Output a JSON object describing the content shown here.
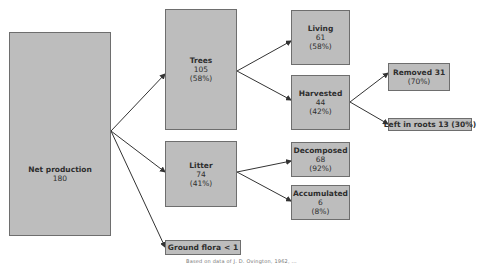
{
  "diagram": {
    "type": "flow",
    "fill_color": "#bdbdbd",
    "border_color": "#6e6e6e",
    "nodes": {
      "net_production": {
        "title": "Net production",
        "value": "180"
      },
      "trees": {
        "title": "Trees",
        "value": "105",
        "percent": "(58%)"
      },
      "litter": {
        "title": "Litter",
        "value": "74",
        "percent": "(41%)"
      },
      "ground_flora": {
        "title": "Ground flora",
        "value": "< 1"
      },
      "living": {
        "title": "Living",
        "value": "61",
        "percent": "(58%)"
      },
      "harvested": {
        "title": "Harvested",
        "value": "44",
        "percent": "(42%)"
      },
      "decomposed": {
        "title": "Decomposed",
        "value": "68",
        "percent": "(92%)"
      },
      "accumulated": {
        "title": "Accumulated",
        "value": "6",
        "percent": "(8%)"
      },
      "removed": {
        "title": "Removed 31",
        "percent": "(70%)"
      },
      "left_in_roots": {
        "title": "Left in roots 13 (30%)"
      }
    },
    "edges": [
      {
        "from": "net_production",
        "to": "trees"
      },
      {
        "from": "net_production",
        "to": "litter"
      },
      {
        "from": "net_production",
        "to": "ground_flora"
      },
      {
        "from": "trees",
        "to": "living"
      },
      {
        "from": "trees",
        "to": "harvested"
      },
      {
        "from": "litter",
        "to": "decomposed"
      },
      {
        "from": "litter",
        "to": "accumulated"
      },
      {
        "from": "harvested",
        "to": "removed"
      },
      {
        "from": "harvested",
        "to": "left_in_roots"
      }
    ],
    "caption": "Based on data of J. D. Ovington, 1962, ..."
  }
}
